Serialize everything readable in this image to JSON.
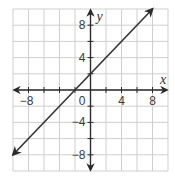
{
  "chart_data": {
    "type": "line",
    "title": "",
    "xlabel": "x",
    "ylabel": "y",
    "xlim": [
      -10,
      10
    ],
    "ylim": [
      -10,
      10
    ],
    "grid": true,
    "grid_step": 2,
    "x_tick_labels": [
      {
        "value": -8,
        "label": "−8"
      },
      {
        "value": 4,
        "label": "4"
      },
      {
        "value": 8,
        "label": "8"
      }
    ],
    "y_tick_labels": [
      {
        "value": 8,
        "label": "8"
      },
      {
        "value": 4,
        "label": "4"
      },
      {
        "value": -4,
        "label": "−4"
      },
      {
        "value": -8,
        "label": "−8"
      }
    ],
    "origin_label": "0",
    "series": [
      {
        "name": "line",
        "equation": "y = x + 2",
        "slope": 1,
        "intercept": 2,
        "x": [
          -10,
          8
        ],
        "y": [
          -8,
          10
        ],
        "arrows": "both"
      }
    ],
    "legend": null
  },
  "colors": {
    "grid": "#cfcfcf",
    "axis": "#2b2b2b",
    "line": "#333333",
    "text": "#3a3a3a"
  }
}
